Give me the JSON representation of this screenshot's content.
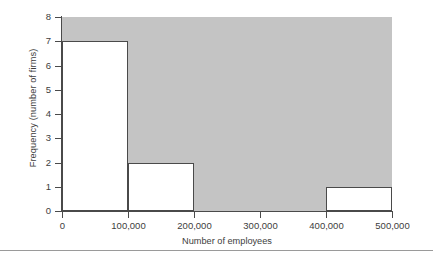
{
  "chart_data": {
    "type": "bar",
    "title": "",
    "subtitle": "",
    "xlabel": "Number of employees",
    "ylabel": "Frequency (number of firms)",
    "xlim": [
      0,
      500000
    ],
    "ylim": [
      0,
      8
    ],
    "grid": false,
    "legend": null,
    "bin_width": 100000,
    "bin_edges": [
      0,
      100000,
      200000,
      300000,
      400000,
      500000
    ],
    "categories": [
      "0-100,000",
      "100,000-200,000",
      "200,000-300,000",
      "300,000-400,000",
      "400,000-500,000"
    ],
    "values": [
      7,
      2,
      0,
      0,
      1
    ],
    "xticks": [
      {
        "value": 0,
        "label": "0"
      },
      {
        "value": 100000,
        "label": "100,000"
      },
      {
        "value": 200000,
        "label": "200,000"
      },
      {
        "value": 300000,
        "label": "300,000"
      },
      {
        "value": 400000,
        "label": "400,000"
      },
      {
        "value": 500000,
        "label": "500,000"
      }
    ],
    "yticks": [
      {
        "value": 0,
        "label": "0"
      },
      {
        "value": 1,
        "label": "1"
      },
      {
        "value": 2,
        "label": "2"
      },
      {
        "value": 3,
        "label": "3"
      },
      {
        "value": 4,
        "label": "4"
      },
      {
        "value": 5,
        "label": "5"
      },
      {
        "value": 6,
        "label": "6"
      },
      {
        "value": 7,
        "label": "7"
      },
      {
        "value": 8,
        "label": "8"
      }
    ],
    "colors": {
      "plot_background": "#c4c4c4",
      "bar_fill": "#ffffff",
      "bar_outline": "#4a4a4a",
      "axis": "#4a4a4a",
      "text": "#3d3d3d",
      "rule": "#9a9a9a"
    }
  }
}
